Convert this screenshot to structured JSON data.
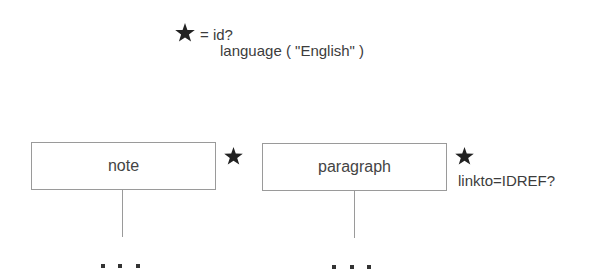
{
  "legend": {
    "symbol": "star-icon",
    "line1": "= id?",
    "line2": "language ( \"English\" )"
  },
  "nodes": [
    {
      "label": "note",
      "marker": "star-icon",
      "attribute": "",
      "continuation": "..."
    },
    {
      "label": "paragraph",
      "marker": "star-icon",
      "attribute": "linkto=IDREF?",
      "continuation": "..."
    }
  ],
  "colors": {
    "star": "#222222",
    "box_border": "#9a9a9a",
    "text": "#3c3c3c",
    "dots": "#333333"
  }
}
